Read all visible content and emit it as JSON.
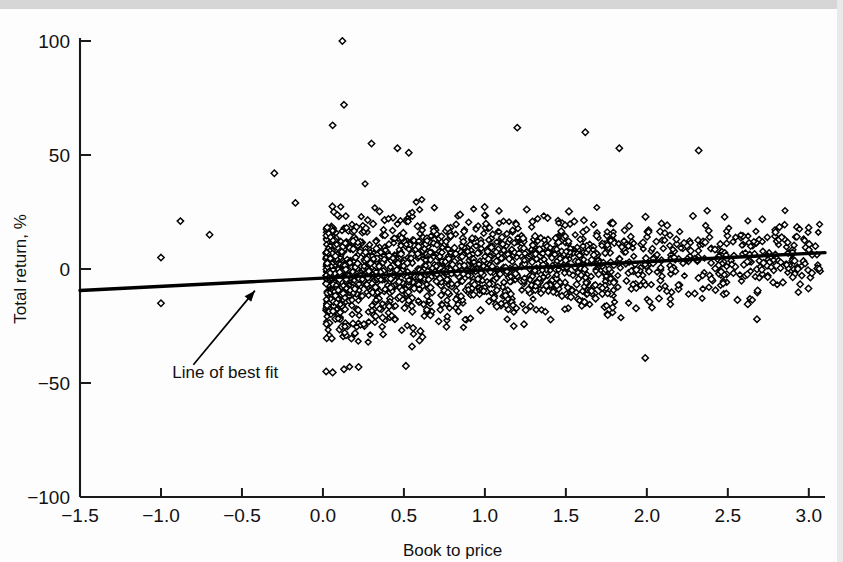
{
  "figure": {
    "background_color": "#fdfdfd",
    "top_band_color": "#d6d6d6",
    "point_color": "#000000",
    "line_color": "#000000"
  },
  "chart_data": {
    "type": "scatter",
    "title": "",
    "subtitle": "",
    "xlabel": "Book to price",
    "ylabel": "Total return, %",
    "xlim": [
      -1.5,
      3.1
    ],
    "ylim": [
      -100,
      100
    ],
    "grid": false,
    "legend": null,
    "xticks": [
      -1.5,
      -1.0,
      -0.5,
      0.0,
      0.5,
      1.0,
      1.5,
      2.0,
      2.5,
      3.0
    ],
    "xticklabels": [
      "−1.5",
      "−1.0",
      "−0.5",
      "0.0",
      "0.5",
      "1.0",
      "1.5",
      "2.0",
      "2.5",
      "3.0"
    ],
    "yticks": [
      100,
      50,
      0,
      -50,
      -100
    ],
    "yticklabels": [
      "100",
      "50",
      "0",
      "−50",
      "−100"
    ],
    "marker": "open-diamond",
    "marker_size_px": 6,
    "n_points_approx": 1800,
    "annotations": [
      {
        "text": "Line of best fit",
        "text_x": -0.93,
        "text_y": -48,
        "arrow_from_x": -0.8,
        "arrow_from_y": -42,
        "arrow_to_x": -0.42,
        "arrow_to_y": -9.5
      }
    ],
    "series": [
      {
        "name": "Line of best fit",
        "type": "line",
        "x": [
          -1.5,
          3.1
        ],
        "y": [
          -9.4,
          7.2
        ],
        "slope": 3.6,
        "intercept": -4.0
      },
      {
        "name": "Stocks",
        "type": "scatter",
        "outliers": [
          {
            "x": 0.12,
            "y": 100
          },
          {
            "x": 0.13,
            "y": 72
          },
          {
            "x": 0.06,
            "y": 63
          },
          {
            "x": 0.3,
            "y": 55
          },
          {
            "x": 0.46,
            "y": 53
          },
          {
            "x": 0.53,
            "y": 51
          },
          {
            "x": 1.2,
            "y": 62
          },
          {
            "x": 1.62,
            "y": 60
          },
          {
            "x": 1.83,
            "y": 53
          },
          {
            "x": 2.32,
            "y": 52
          },
          {
            "x": -0.3,
            "y": 42
          },
          {
            "x": -0.88,
            "y": 21
          },
          {
            "x": -0.7,
            "y": 15
          },
          {
            "x": -1.0,
            "y": 5
          },
          {
            "x": -1.0,
            "y": -15
          },
          {
            "x": -0.17,
            "y": 29
          },
          {
            "x": 1.99,
            "y": -39
          },
          {
            "x": 2.68,
            "y": -22
          },
          {
            "x": 0.55,
            "y": -34
          },
          {
            "x": 0.13,
            "y": -44
          },
          {
            "x": 0.22,
            "y": -43
          }
        ],
        "cloud": {
          "x_range": [
            0.02,
            3.08
          ],
          "y_center_at_x0": -3.0,
          "y_center_at_x3": 6.0,
          "y_spread_at_x0": 17,
          "y_spread_at_x3": 11,
          "density_profile": "dense near x=0.0-1.8, thinning toward x=3.0"
        }
      }
    ]
  }
}
